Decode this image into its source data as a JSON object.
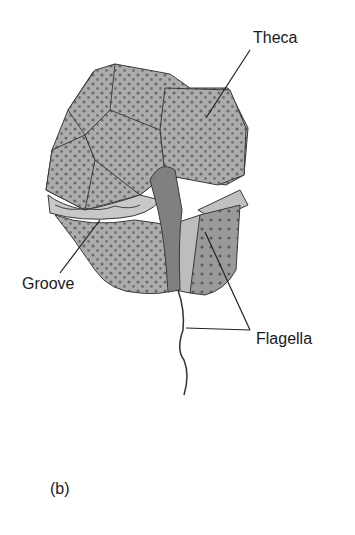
{
  "figure": {
    "panel_label": "(b)",
    "labels": {
      "theca": "Theca",
      "groove": "Groove",
      "flagella": "Flagella"
    },
    "colors": {
      "plate_fill": "#a9a9a9",
      "plate_dark": "#7d7d7d",
      "dots": "#6a6a6a",
      "outline": "#3a3a3a",
      "line": "#222222"
    }
  }
}
